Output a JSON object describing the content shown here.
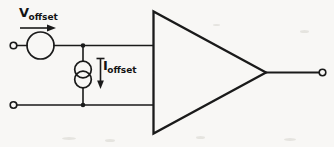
{
  "figure": {
    "background_color": "#f8f7f5",
    "ink_color": "#1a1a1a",
    "width": 334,
    "height": 147
  },
  "labels": {
    "voltage_offset": {
      "base": "V",
      "subscript": "offset",
      "full": "Voffset"
    },
    "current_offset": {
      "base": "I",
      "subscript": "offset",
      "full": "Ioffset"
    }
  },
  "components": {
    "voltage_source": {
      "name": "voltage-source",
      "shape": "circle",
      "cx": 40.5,
      "cy": 45.5,
      "r": 13.5
    },
    "current_source": {
      "name": "current-source",
      "shape": "double-circle",
      "cx": 83,
      "cy_top": 69,
      "cy_bottom": 80,
      "r": 8.5
    },
    "op_amp": {
      "name": "operational-amplifier",
      "shape": "triangle",
      "left_x": 153,
      "top_y": 11,
      "bottom_y": 134,
      "tip_x": 266,
      "tip_y": 72.5
    }
  },
  "terminals": [
    {
      "name": "input-terminal-positive",
      "cx": 13.5,
      "cy": 45.5,
      "r": 3.4
    },
    {
      "name": "input-terminal-negative",
      "cx": 13.5,
      "cy": 105,
      "r": 3.4
    },
    {
      "name": "output-terminal",
      "cx": 322.5,
      "cy": 72.5,
      "r": 3.4
    }
  ],
  "wires": [
    {
      "name": "wire-top-left-terminal-to-source",
      "points": "17,45.5 27,45.5"
    },
    {
      "name": "wire-source-to-opamp-input",
      "points": "54,45.5 153,45.5"
    },
    {
      "name": "wire-bottom-rail",
      "points": "17,105 153,105"
    },
    {
      "name": "wire-current-source-top-stub",
      "points": "83,45.5 83,60.5"
    },
    {
      "name": "wire-current-source-bottom-stub",
      "points": "83,88.5 83,105"
    },
    {
      "name": "wire-opamp-output",
      "points": "266,72.5 319,72.5"
    }
  ],
  "junctions": [
    {
      "name": "junction-top-node",
      "cx": 83,
      "cy": 45.5,
      "r": 2.2
    },
    {
      "name": "junction-bottom-node",
      "cx": 83,
      "cy": 105,
      "r": 2.2
    }
  ],
  "arrows": [
    {
      "name": "voltage-direction-arrow",
      "direction": "right",
      "x1": 20,
      "y1": 28,
      "x2": 52,
      "y2": 28
    },
    {
      "name": "current-direction-arrow",
      "direction": "down",
      "x1": 100.5,
      "y1": 59,
      "x2": 100.5,
      "y2": 86,
      "has_top_cap": true
    }
  ]
}
